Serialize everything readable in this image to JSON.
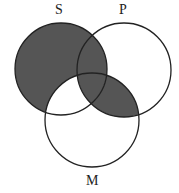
{
  "diagram": {
    "type": "venn",
    "circles": [
      {
        "name": "S",
        "cx": 61,
        "cy": 69,
        "r": 46
      },
      {
        "name": "P",
        "cx": 124,
        "cy": 70,
        "r": 47
      },
      {
        "name": "M",
        "cx": 92,
        "cy": 120,
        "r": 47
      }
    ],
    "labels": {
      "s": "S",
      "p": "P",
      "m": "M"
    },
    "shade_color": "#555555",
    "stroke_color": "#222222",
    "shaded_regions": [
      "S only",
      "S and P only",
      "S and P and M",
      "P and M only"
    ],
    "unshaded_regions": [
      "S and M only",
      "P only",
      "M only"
    ]
  }
}
